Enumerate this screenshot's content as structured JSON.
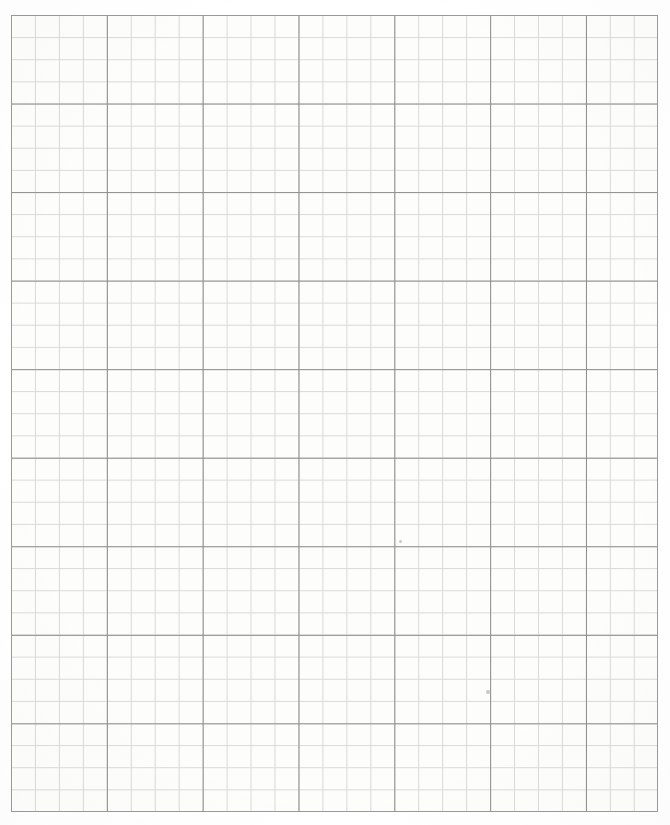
{
  "document": {
    "kind": "graph-paper-scan",
    "title": "Blank quadrille graph paper sheet",
    "page_width": 670,
    "page_height": 825,
    "background_color": "#ffffff"
  },
  "grid": {
    "origin_x": 11,
    "origin_y": 15,
    "width": 647,
    "height": 797,
    "columns": 27,
    "rows": 36,
    "cell_width": 23.96,
    "cell_height": 22.14,
    "major_every": 4,
    "paper_color": "#fdfdfc",
    "minor_line_color": "#d9d9d7",
    "major_line_color": "#8d8d8b",
    "border_color": "#9a9a9a",
    "minor_line_width": 1,
    "major_line_width": 1
  },
  "marks": [
    {
      "label": "pencil-dot-1",
      "x": 400,
      "y": 541,
      "size": 3
    },
    {
      "label": "pencil-dot-2",
      "x": 488,
      "y": 692,
      "size": 4
    }
  ],
  "text": {
    "page_label": "",
    "annotations": []
  }
}
